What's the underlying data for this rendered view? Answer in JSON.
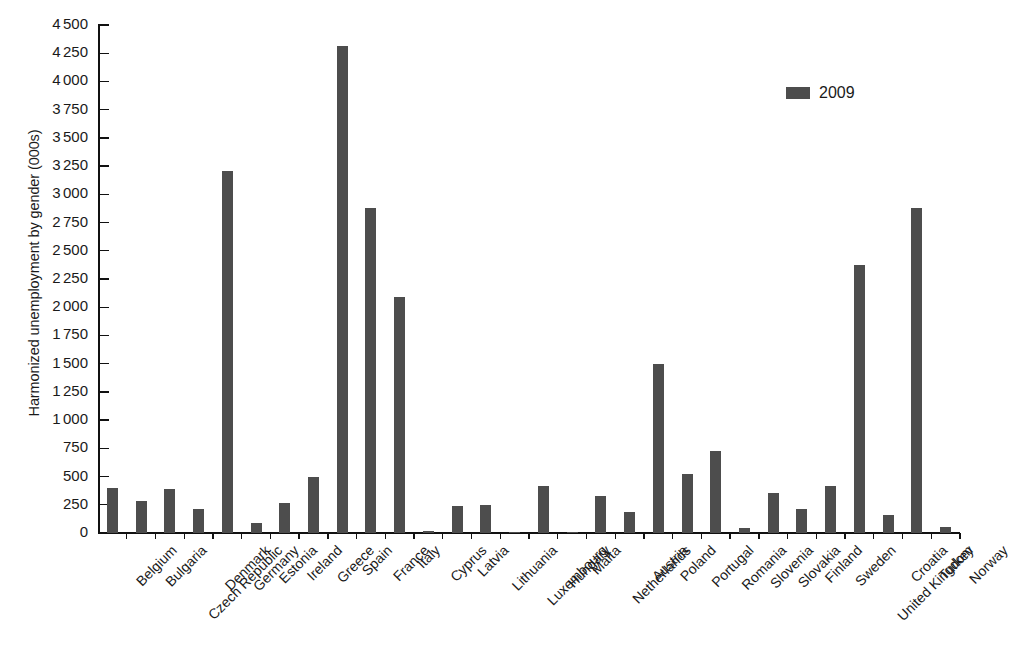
{
  "chart_data": {
    "type": "bar",
    "title": "",
    "xlabel": "",
    "ylabel": "Harmonized unemployment by gender (000s)",
    "ylim": [
      0,
      4500
    ],
    "ytick_step": 250,
    "ytick_labels": [
      "0",
      "250",
      "500",
      "750",
      "1 000",
      "1 250",
      "1 500",
      "1 750",
      "2 000",
      "2 250",
      "2 500",
      "2 750",
      "3 000",
      "3 250",
      "3 500",
      "3 750",
      "4 000",
      "4 250",
      "4 500"
    ],
    "grid": false,
    "legend_position": "top-right",
    "bar_color": "#4d4d4d",
    "axis_color": "#111111",
    "background": "#ffffff",
    "series": [
      {
        "name": "2009",
        "values": [
          395,
          285,
          390,
          215,
          3210,
          90,
          270,
          495,
          4310,
          2880,
          2090,
          20,
          235,
          245,
          10,
          420,
          12,
          325,
          190,
          1495,
          525,
          730,
          45,
          355,
          210,
          415,
          2370,
          160,
          2880,
          50
        ]
      }
    ],
    "categories": [
      "Belgium",
      "Bulgaria",
      "Czech Republic",
      "Denmark",
      "Germany",
      "Estonia",
      "Ireland",
      "Greece",
      "Spain",
      "France",
      "Italy",
      "Cyprus",
      "Latvia",
      "Lithuania",
      "Luxembourg",
      "Hungary",
      "Malta",
      "Netherlands",
      "Austria",
      "Poland",
      "Portugal",
      "Romania",
      "Slovenia",
      "Slovakia",
      "Finland",
      "Sweden",
      "United Kingdom",
      "Croatia",
      "Turkey",
      "Norway"
    ]
  },
  "legend": {
    "entries": [
      {
        "label": "2009",
        "color": "#4d4d4d",
        "swatch_icon": "square-swatch-icon"
      }
    ]
  },
  "axes": {
    "y_title": "Harmonized unemployment by gender (000s)"
  }
}
